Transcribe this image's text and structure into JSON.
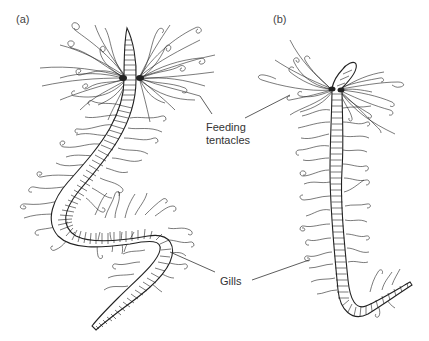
{
  "figure": {
    "panels": [
      {
        "id": "a",
        "label": "(a)"
      },
      {
        "id": "b",
        "label": "(b)"
      }
    ],
    "annotations": {
      "feeding_tentacles": {
        "line1": "Feeding",
        "line2": "tentacles"
      },
      "gills": "Gills"
    }
  }
}
